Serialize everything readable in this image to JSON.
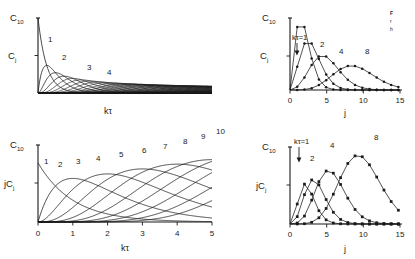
{
  "figure": {
    "background": "#ffffff",
    "ink": "#1a1a1a",
    "panels": [
      {
        "id": "top-left",
        "name": "panel-cj-vs-ktau",
        "ylabel_top": "C",
        "ylabel_top_sub": "10",
        "ylabel": "C",
        "ylabel_sub": "j",
        "xlabel": "kτ",
        "curve_labels": [
          "1",
          "2",
          "3",
          "4"
        ]
      },
      {
        "id": "top-right",
        "name": "panel-cj-vs-j",
        "ylabel_top": "C",
        "ylabel_top_sub": "10",
        "ylabel": "C",
        "ylabel_sub": "j",
        "xlabel": "j",
        "annotation": "kτ=1",
        "curve_labels": [
          "2",
          "4",
          "8"
        ],
        "xticks": [
          "0",
          "5",
          "10",
          "15"
        ]
      },
      {
        "id": "bottom-left",
        "name": "panel-jcj-vs-ktau",
        "ylabel_top": "C",
        "ylabel_top_sub": "10",
        "ylabel": "jC",
        "ylabel_sub": "j",
        "xlabel": "kτ",
        "curve_labels": [
          "1",
          "2",
          "3",
          "4",
          "5",
          "6",
          "7",
          "8",
          "9",
          "10"
        ],
        "xticks": [
          "0",
          "1",
          "2",
          "3",
          "4",
          "5"
        ]
      },
      {
        "id": "bottom-right",
        "name": "panel-jcj-vs-j",
        "ylabel_top": "C",
        "ylabel_top_sub": "10",
        "ylabel": "jC",
        "ylabel_sub": "j",
        "xlabel": "j",
        "annotation": "kτ=1",
        "curve_labels": [
          "2",
          "4",
          "8"
        ],
        "xticks": [
          "0",
          "5",
          "10",
          "15"
        ]
      }
    ],
    "caption_lines": [
      "F",
      "r",
      "h"
    ]
  },
  "chart_data": [
    {
      "type": "line",
      "id": "top-left",
      "title": "",
      "xlabel": "kτ",
      "ylabel": "C_j",
      "xlim": [
        0,
        20
      ],
      "ylim": [
        0,
        1
      ],
      "grid": false,
      "legend": "inline-curve-labels",
      "description": "Poisson chain-length fractions C_j = (kτ)^(j-1) e^(-kτ)/(j-1)! plotted against kτ for j = 1..30; higher j curves merge into a dark band.",
      "labelled_curves": [
        1,
        2,
        3,
        4
      ],
      "n_curves": 30,
      "series": [
        {
          "name": "j=1",
          "peak_x": 0.0,
          "peak_y": 1.0
        },
        {
          "name": "j=2",
          "peak_x": 1.0,
          "peak_y": 0.368
        },
        {
          "name": "j=3",
          "peak_x": 2.0,
          "peak_y": 0.271
        },
        {
          "name": "j=4",
          "peak_x": 3.0,
          "peak_y": 0.224
        }
      ]
    },
    {
      "type": "line",
      "id": "bottom-left",
      "title": "",
      "xlabel": "kτ",
      "ylabel": "jC_j",
      "xlim": [
        0,
        5
      ],
      "ylim": [
        0,
        1
      ],
      "xticks": [
        0,
        1,
        2,
        3,
        4,
        5
      ],
      "grid": false,
      "legend": "inline-curve-labels",
      "description": "Weight fractions jC_j versus kτ for j = 1..10; peaks move right and grow with j.",
      "labelled_curves": [
        1,
        2,
        3,
        4,
        5,
        6,
        7,
        8,
        9,
        10
      ],
      "n_curves": 10,
      "series": [
        {
          "name": "j=1",
          "peak_x": 0.0,
          "peak_y": 1.0
        },
        {
          "name": "j=2",
          "peak_x": 0.45,
          "peak_y": 0.64
        },
        {
          "name": "j=3",
          "peak_x": 0.95,
          "peak_y": 0.78
        },
        {
          "name": "j=4",
          "peak_x": 1.45,
          "peak_y": 0.86
        },
        {
          "name": "j=5",
          "peak_x": 1.95,
          "peak_y": 0.92
        },
        {
          "name": "j=6",
          "peak_x": 2.45,
          "peak_y": 0.98
        },
        {
          "name": "j=7",
          "peak_x": 2.95,
          "peak_y": 1.03
        },
        {
          "name": "j=8",
          "peak_x": 3.45,
          "peak_y": 1.08
        },
        {
          "name": "j=9",
          "peak_x": 3.95,
          "peak_y": 1.12
        },
        {
          "name": "j=10",
          "peak_x": 4.45,
          "peak_y": 1.16
        }
      ]
    },
    {
      "type": "line",
      "id": "top-right",
      "title": "",
      "xlabel": "j",
      "ylabel": "C_j",
      "xlim": [
        0,
        15.5
      ],
      "ylim": [
        0,
        1
      ],
      "xticks": [
        0,
        5,
        10,
        15
      ],
      "grid": false,
      "markers": "filled-circle",
      "legend": "inline-curve-labels",
      "description": "Chain-length distribution C_j versus j at four reaction times kτ = 1, 2, 4, 8.",
      "categories": [
        0,
        1,
        2,
        3,
        4,
        5,
        6,
        7,
        8,
        9,
        10,
        11,
        12,
        13,
        14,
        15
      ],
      "series": [
        {
          "name": "kτ=1",
          "values": [
            0.0,
            0.368,
            0.368,
            0.184,
            0.061,
            0.015,
            0.003,
            0.001,
            0.0,
            0.0,
            0.0,
            0.0,
            0.0,
            0.0,
            0.0,
            0.0
          ]
        },
        {
          "name": "kτ=2",
          "values": [
            0.0,
            0.135,
            0.271,
            0.271,
            0.18,
            0.09,
            0.036,
            0.012,
            0.003,
            0.001,
            0.0,
            0.0,
            0.0,
            0.0,
            0.0,
            0.0
          ]
        },
        {
          "name": "kτ=4",
          "values": [
            0.0,
            0.018,
            0.073,
            0.147,
            0.195,
            0.195,
            0.156,
            0.104,
            0.06,
            0.03,
            0.013,
            0.005,
            0.002,
            0.001,
            0.0,
            0.0
          ]
        },
        {
          "name": "kτ=8",
          "values": [
            0.0,
            0.0,
            0.003,
            0.011,
            0.029,
            0.057,
            0.092,
            0.122,
            0.14,
            0.14,
            0.124,
            0.099,
            0.072,
            0.048,
            0.03,
            0.017
          ]
        }
      ]
    },
    {
      "type": "line",
      "id": "bottom-right",
      "title": "",
      "xlabel": "j",
      "ylabel": "jC_j",
      "xlim": [
        0,
        15.5
      ],
      "ylim": [
        0,
        1.4
      ],
      "xticks": [
        0,
        5,
        10,
        15
      ],
      "grid": false,
      "markers": "filled-square",
      "legend": "inline-curve-labels",
      "description": "Weight distribution jC_j versus j at reaction times kτ = 1, 2, 4, 8.",
      "categories": [
        0,
        1,
        2,
        3,
        4,
        5,
        6,
        7,
        8,
        9,
        10,
        11,
        12,
        13,
        14,
        15
      ],
      "series": [
        {
          "name": "kτ=1",
          "values": [
            0.0,
            0.368,
            0.736,
            0.552,
            0.245,
            0.075,
            0.018,
            0.004,
            0.001,
            0.0,
            0.0,
            0.0,
            0.0,
            0.0,
            0.0,
            0.0
          ]
        },
        {
          "name": "kτ=2",
          "values": [
            0.0,
            0.135,
            0.541,
            0.812,
            0.722,
            0.451,
            0.217,
            0.084,
            0.028,
            0.008,
            0.002,
            0.0,
            0.0,
            0.0,
            0.0,
            0.0
          ]
        },
        {
          "name": "kτ=4",
          "values": [
            0.0,
            0.018,
            0.147,
            0.44,
            0.782,
            0.977,
            0.938,
            0.729,
            0.478,
            0.273,
            0.138,
            0.063,
            0.026,
            0.01,
            0.003,
            0.001
          ]
        },
        {
          "name": "kτ=8",
          "values": [
            0.0,
            0.003,
            0.005,
            0.032,
            0.114,
            0.286,
            0.551,
            0.857,
            1.12,
            1.26,
            1.24,
            1.089,
            0.866,
            0.629,
            0.42,
            0.259
          ]
        }
      ]
    }
  ]
}
